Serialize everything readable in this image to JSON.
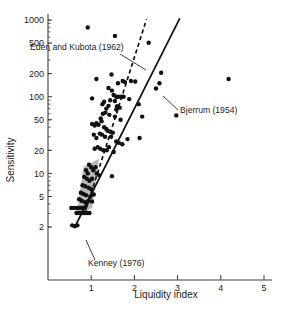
{
  "figure": {
    "name": "sensitivity-vs-liquidity-index-scatter",
    "caption_partial": ""
  },
  "chart_data": {
    "type": "scatter",
    "title": "",
    "xlabel": "Liquidity index",
    "ylabel": "Sensitivity",
    "yscale": "log",
    "xscale": "linear",
    "xlim": [
      0.25,
      5.15
    ],
    "ylim": [
      1.7,
      1100
    ],
    "grid": false,
    "legend_position": "none",
    "xticks": [
      1,
      2,
      3,
      4,
      5
    ],
    "xtick_labels": [
      "1",
      "2",
      "3",
      "4",
      "5"
    ],
    "yticks": [
      2,
      5,
      10,
      20,
      50,
      100,
      200,
      500,
      1000
    ],
    "ytick_labels": [
      "2",
      "5",
      "10",
      "20",
      "50",
      "100",
      "200",
      "500",
      "1000"
    ],
    "points": [
      [
        0.92,
        800
      ],
      [
        1.55,
        620
      ],
      [
        2.33,
        505
      ],
      [
        1.12,
        170
      ],
      [
        1.47,
        195
      ],
      [
        1.62,
        150
      ],
      [
        1.73,
        160
      ],
      [
        1.78,
        155
      ],
      [
        1.92,
        160
      ],
      [
        2.02,
        158
      ],
      [
        2.62,
        205
      ],
      [
        2.58,
        150
      ],
      [
        4.18,
        170
      ],
      [
        1.02,
        95
      ],
      [
        1.4,
        130
      ],
      [
        1.48,
        120
      ],
      [
        1.52,
        105
      ],
      [
        1.58,
        100
      ],
      [
        1.63,
        100
      ],
      [
        1.7,
        100
      ],
      [
        1.75,
        100
      ],
      [
        1.88,
        93
      ],
      [
        2.1,
        80
      ],
      [
        2.5,
        128
      ],
      [
        1.27,
        60
      ],
      [
        1.33,
        62
      ],
      [
        1.42,
        58
      ],
      [
        1.55,
        55
      ],
      [
        1.68,
        50
      ],
      [
        1.22,
        52
      ],
      [
        1.24,
        48
      ],
      [
        2.18,
        55
      ],
      [
        2.97,
        57
      ],
      [
        1.3,
        40
      ],
      [
        1.35,
        38
      ],
      [
        1.38,
        36
      ],
      [
        1.44,
        35
      ],
      [
        1.5,
        34
      ],
      [
        1.2,
        33
      ],
      [
        1.25,
        32
      ],
      [
        1.32,
        30
      ],
      [
        1.46,
        30
      ],
      [
        1.06,
        32
      ],
      [
        1.12,
        29
      ],
      [
        1.84,
        28
      ],
      [
        2.12,
        29
      ],
      [
        1.15,
        22
      ],
      [
        1.21,
        21
      ],
      [
        1.28,
        20
      ],
      [
        1.36,
        20
      ],
      [
        1.41,
        22
      ],
      [
        1.08,
        21
      ],
      [
        1.52,
        19
      ],
      [
        0.95,
        13
      ],
      [
        1.0,
        12
      ],
      [
        1.05,
        11
      ],
      [
        1.1,
        12
      ],
      [
        1.13,
        10
      ],
      [
        0.88,
        11
      ],
      [
        0.92,
        10
      ],
      [
        1.18,
        9.5
      ],
      [
        1.48,
        9.2
      ],
      [
        0.84,
        9
      ],
      [
        0.9,
        8.5
      ],
      [
        0.96,
        8
      ],
      [
        1.02,
        8.5
      ],
      [
        0.8,
        7
      ],
      [
        0.86,
        6.8
      ],
      [
        0.94,
        6.5
      ],
      [
        1.0,
        6.2
      ],
      [
        0.76,
        5.6
      ],
      [
        0.82,
        5.4
      ],
      [
        0.88,
        5.2
      ],
      [
        0.98,
        5.0
      ],
      [
        1.06,
        5.3
      ],
      [
        0.72,
        4.6
      ],
      [
        0.78,
        4.4
      ],
      [
        0.86,
        4.2
      ],
      [
        0.94,
        4.4
      ],
      [
        1.02,
        4.3
      ],
      [
        0.54,
        3.55
      ],
      [
        0.6,
        3.55
      ],
      [
        0.65,
        3.55
      ],
      [
        0.7,
        3.55
      ],
      [
        0.75,
        3.55
      ],
      [
        0.8,
        3.55
      ],
      [
        0.86,
        3.6
      ],
      [
        0.66,
        3.05
      ],
      [
        0.72,
        3.05
      ],
      [
        0.78,
        3.05
      ],
      [
        0.84,
        3.05
      ],
      [
        0.9,
        3.05
      ],
      [
        0.96,
        3.05
      ],
      [
        0.56,
        2.1
      ],
      [
        0.62,
        2.05
      ],
      [
        0.68,
        2.1
      ],
      [
        1.6,
        75
      ],
      [
        1.66,
        72
      ],
      [
        1.58,
        68
      ],
      [
        1.35,
        70
      ],
      [
        1.4,
        76
      ],
      [
        1.26,
        80
      ],
      [
        1.3,
        86
      ],
      [
        1.44,
        90
      ],
      [
        1.55,
        88
      ],
      [
        1.12,
        45
      ],
      [
        1.17,
        43
      ],
      [
        1.08,
        42
      ],
      [
        1.02,
        44
      ],
      [
        1.64,
        25
      ],
      [
        1.72,
        24
      ],
      [
        1.58,
        26
      ]
    ],
    "trend_lines": [
      {
        "name": "Eden and Kubota (1962)",
        "style": "dashed",
        "x_start": 0.85,
        "y_start": 3.0,
        "x_end": 2.28,
        "y_end": 1020
      },
      {
        "name": "Bjerrum (1954)",
        "style": "solid",
        "x_start": 0.62,
        "y_start": 2.0,
        "x_end": 3.05,
        "y_end": 1050
      }
    ],
    "shaded_zones": [
      {
        "name": "Kenney (1976)",
        "color": "#b8b8b8",
        "vertices": [
          [
            0.66,
            2.85
          ],
          [
            1.02,
            3.5
          ],
          [
            1.18,
            15.5
          ],
          [
            0.82,
            12.2
          ]
        ]
      }
    ],
    "annotations": [
      {
        "id": "eden-kubota",
        "label": "Eden and Kubota (1962)",
        "text_x": 30,
        "text_y": 50,
        "leader": [
          [
            120,
            54
          ],
          [
            146,
            70
          ]
        ]
      },
      {
        "id": "bjerrum",
        "label": "Bjerrum (1954)",
        "text_x": 180,
        "text_y": 113,
        "leader": [
          [
            178,
            110
          ],
          [
            163,
            96
          ]
        ]
      },
      {
        "id": "kenney",
        "label": "Kenney (1976)",
        "text_x": 88,
        "text_y": 266,
        "leader": [
          [
            95,
            260
          ],
          [
            86,
            240
          ]
        ]
      }
    ]
  }
}
